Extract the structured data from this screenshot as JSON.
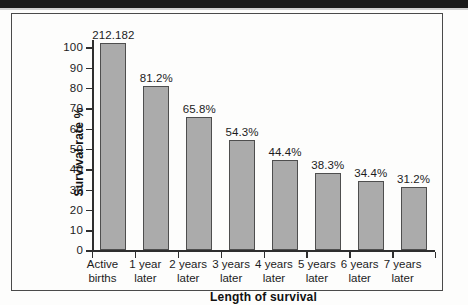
{
  "figure": {
    "y_axis_title": "Survival rate %",
    "x_axis_title": "Length of survival"
  },
  "chart_data": {
    "type": "bar",
    "title": "",
    "xlabel": "Length of survival",
    "ylabel": "Survival rate %",
    "ylim": [
      0,
      100
    ],
    "yticks": [
      0,
      10,
      20,
      30,
      40,
      50,
      60,
      70,
      80,
      90,
      100
    ],
    "ytick_labels": [
      "0",
      "10",
      "20",
      "30",
      "40",
      "50",
      "60",
      "70",
      "80",
      "90",
      "100"
    ],
    "grid": false,
    "legend": null,
    "categories": [
      "Active births",
      "1 year later",
      "2 years later",
      "3 years later",
      "4 years later",
      "5 years later",
      "6 years later",
      "7 years later"
    ],
    "category_lines": [
      [
        "Active",
        "births"
      ],
      [
        "1 year",
        "later"
      ],
      [
        "2 years",
        "later"
      ],
      [
        "3 years",
        "later"
      ],
      [
        "4 years",
        "later"
      ],
      [
        "5 years",
        "later"
      ],
      [
        "6 years",
        "later"
      ],
      [
        "7 years",
        "later"
      ]
    ],
    "values": [
      102.0,
      81.2,
      65.8,
      54.3,
      44.4,
      38.3,
      34.4,
      31.2
    ],
    "data_labels": [
      "212.182",
      "81.2%",
      "65.8%",
      "54.3%",
      "44.4%",
      "38.3%",
      "34.4%",
      "31.2%"
    ],
    "bar_color": "#ababab",
    "bar_edge_color": "#4e4e4e"
  }
}
